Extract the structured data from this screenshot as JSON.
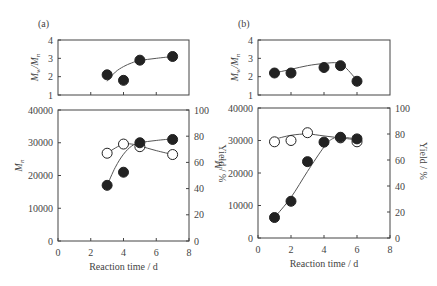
{
  "chart_data": [
    {
      "panel": "(a)",
      "type": "scatter",
      "subplots": [
        {
          "name": "dispersity",
          "ylabel": "Mw/Mn",
          "ylim": [
            1,
            4
          ],
          "yticks": [
            1,
            2,
            3,
            4
          ],
          "xlim": [
            0,
            8
          ],
          "series": [
            {
              "name": "Mw/Mn",
              "marker": "filled-circle",
              "x": [
                3,
                4,
                5,
                7
              ],
              "y": [
                2.1,
                1.8,
                2.9,
                3.1
              ]
            }
          ],
          "curve": [
            [
              3,
              1.75
            ],
            [
              3.5,
              2.25
            ],
            [
              4,
              2.55
            ],
            [
              4.5,
              2.75
            ],
            [
              5,
              2.88
            ],
            [
              6,
              3.0
            ],
            [
              7,
              3.1
            ]
          ]
        },
        {
          "name": "molecular-weight-and-yield",
          "xlabel": "Reaction time / d",
          "ylabel": "Mn",
          "ylabel_right": "Yield / %",
          "xlim": [
            0,
            8
          ],
          "xticks": [
            0,
            2,
            4,
            6,
            8
          ],
          "ylim": [
            0,
            40000
          ],
          "yticks": [
            0,
            10000,
            20000,
            30000,
            40000
          ],
          "ylim_right": [
            0,
            100
          ],
          "yticks_right": [
            0,
            20,
            40,
            60,
            80,
            100
          ],
          "series": [
            {
              "name": "Mn",
              "marker": "filled-circle",
              "axis": "left",
              "x": [
                3,
                4,
                5,
                7
              ],
              "y": [
                17000,
                21000,
                30000,
                31000
              ]
            },
            {
              "name": "Yield",
              "marker": "open-circle",
              "axis": "right",
              "x": [
                3,
                4,
                5,
                7
              ],
              "y": [
                67,
                74,
                72,
                66
              ]
            }
          ],
          "curve_mn": [
            [
              3,
              17000
            ],
            [
              3.5,
              22500
            ],
            [
              4,
              26500
            ],
            [
              4.5,
              29000
            ],
            [
              5,
              30000
            ],
            [
              6,
              30700
            ],
            [
              7,
              31200
            ]
          ],
          "curve_yield": [
            [
              3,
              67
            ],
            [
              3.5,
              71
            ],
            [
              4,
              74
            ],
            [
              4.5,
              74
            ],
            [
              5,
              72.5
            ],
            [
              6,
              69
            ],
            [
              7,
              66
            ]
          ]
        }
      ]
    },
    {
      "panel": "(b)",
      "type": "scatter",
      "subplots": [
        {
          "name": "dispersity",
          "ylabel": "Mw/Mn",
          "ylim": [
            1,
            4
          ],
          "yticks": [
            1,
            2,
            3,
            4
          ],
          "xlim": [
            0,
            8
          ],
          "series": [
            {
              "name": "Mw/Mn",
              "marker": "filled-circle",
              "x": [
                1,
                2,
                4,
                5,
                6
              ],
              "y": [
                2.2,
                2.2,
                2.5,
                2.6,
                1.75
              ]
            }
          ],
          "curve": [
            [
              1,
              2.2
            ],
            [
              2,
              2.4
            ],
            [
              3,
              2.6
            ],
            [
              4,
              2.72
            ],
            [
              4.8,
              2.75
            ],
            [
              5.3,
              2.5
            ],
            [
              6,
              1.8
            ]
          ]
        },
        {
          "name": "molecular-weight-and-yield",
          "xlabel": "Reaction time / d",
          "ylabel": "Mn",
          "ylabel_right": "Yield / %",
          "xlim": [
            0,
            8
          ],
          "xticks": [
            0,
            2,
            4,
            6,
            8
          ],
          "ylim": [
            0,
            40000
          ],
          "yticks": [
            0,
            10000,
            20000,
            30000,
            40000
          ],
          "ylim_right": [
            0,
            100
          ],
          "yticks_right": [
            0,
            20,
            40,
            60,
            80,
            100
          ],
          "series": [
            {
              "name": "Mn",
              "marker": "filled-circle",
              "axis": "left",
              "x": [
                1,
                2,
                3,
                4,
                5,
                6
              ],
              "y": [
                6300,
                11300,
                23500,
                29500,
                31000,
                30500
              ]
            },
            {
              "name": "Yield",
              "marker": "open-circle",
              "axis": "right",
              "x": [
                1,
                2,
                3,
                5,
                6
              ],
              "y": [
                74,
                75,
                81,
                77,
                74
              ]
            }
          ],
          "curve_mn": [
            [
              1,
              6300
            ],
            [
              2,
              12500
            ],
            [
              3,
              20500
            ],
            [
              4,
              28000
            ],
            [
              4.5,
              30500
            ],
            [
              5,
              31000
            ],
            [
              6,
              30500
            ]
          ],
          "curve_yield": [
            [
              1,
              76
            ],
            [
              2,
              79
            ],
            [
              3,
              80
            ],
            [
              4,
              78.5
            ],
            [
              5,
              77
            ],
            [
              6,
              75.5
            ]
          ]
        }
      ]
    }
  ],
  "labels": {
    "panel_a": "(a)",
    "panel_b": "(b)",
    "xlabel": "Reaction time / d",
    "ylabel_disp": "Mw/Mn",
    "ylabel_mn": "Mn",
    "ylabel_yield": "Yield / %"
  }
}
